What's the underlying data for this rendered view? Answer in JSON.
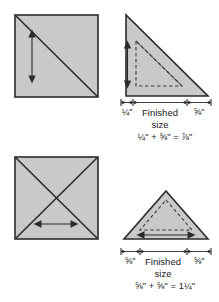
{
  "figure": {
    "colors": {
      "fabric_fill": "#c9c9c9",
      "outline": "#2b2b2b",
      "dashed_guide": "#3a3a3a",
      "background": "#ffffff"
    }
  },
  "panels": {
    "top_left": {
      "name": "square-single-diagonal",
      "shape": "square",
      "diagonals": 1,
      "arrow": "vertical-double"
    },
    "top_right": {
      "name": "half-square-triangle",
      "shape": "right-triangle",
      "arrow": "vertical-double",
      "dimensions": {
        "left_label": "¼\"",
        "center_label_line1": "Finished",
        "center_label_line2": "size",
        "right_label": "⅝\""
      },
      "equation": "¼\" + ⅝\" = ⅞\""
    },
    "bottom_left": {
      "name": "square-double-diagonal",
      "shape": "square",
      "diagonals": 2,
      "arrow": "horizontal-double"
    },
    "bottom_right": {
      "name": "quarter-square-triangle",
      "shape": "isoceles-triangle",
      "arrow": "horizontal-double",
      "dimensions": {
        "left_label": "⅝\"",
        "center_label_line1": "Finished",
        "center_label_line2": "size",
        "right_label": "⅝\""
      },
      "equation": "⅝\" + ⅝\" = 1¼\""
    }
  }
}
